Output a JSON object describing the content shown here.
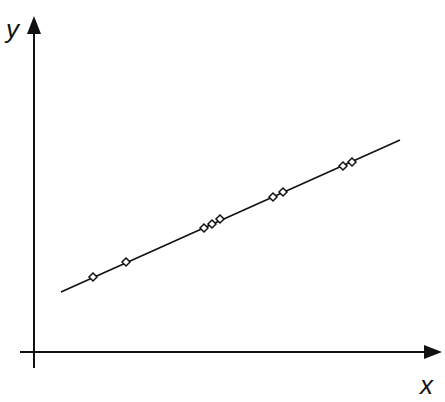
{
  "chart_data": {
    "type": "scatter",
    "title": "",
    "xlabel": "x",
    "ylabel": "y",
    "grid": false,
    "legend": null,
    "axis_ticks": "none",
    "note": "Points lie on a fitted straight line; coordinates in pixel-relative units (origin at axes intersection).",
    "points": [
      {
        "x": 59,
        "y": 75
      },
      {
        "x": 92,
        "y": 90
      },
      {
        "x": 170,
        "y": 124
      },
      {
        "x": 178,
        "y": 128
      },
      {
        "x": 186,
        "y": 133
      },
      {
        "x": 239,
        "y": 155
      },
      {
        "x": 249,
        "y": 160
      },
      {
        "x": 309,
        "y": 186
      },
      {
        "x": 318,
        "y": 190
      }
    ],
    "fit_line": {
      "x_start": 27,
      "y_start": 60,
      "x_end": 366,
      "y_end": 212
    }
  },
  "axes": {
    "x_label": "x",
    "y_label": "y"
  }
}
